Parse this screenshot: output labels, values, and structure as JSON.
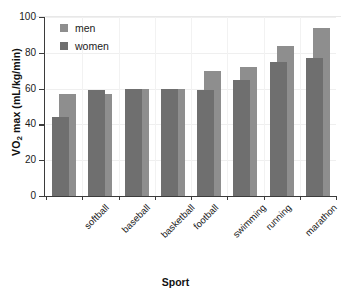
{
  "chart_data": {
    "type": "bar",
    "title": "",
    "xlabel": "Sport",
    "ylabel_html": "VO2 max (mL/kg/min)",
    "ylabel_main": "VO",
    "ylabel_sub": "2",
    "ylabel_rest": " max (mL/kg/min)",
    "categories": [
      "softball",
      "baseball",
      "basketball",
      "football",
      "swimming",
      "running",
      "marathon",
      "cross country skiing"
    ],
    "series": [
      {
        "name": "men",
        "color": "#8e8e8e",
        "values": [
          57,
          57,
          60,
          60,
          70,
          72,
          84,
          94
        ]
      },
      {
        "name": "women",
        "color": "#6f6f6f",
        "values": [
          44,
          59,
          60,
          60,
          59,
          65,
          75,
          77
        ]
      }
    ],
    "ylim": [
      0,
      100
    ],
    "yticks": [
      0,
      20,
      40,
      60,
      80,
      100
    ],
    "ytick_labels": [
      "0",
      "20",
      "40",
      "60",
      "80",
      "100"
    ],
    "grid": "horizontal-and-vertical-light",
    "legend_position": "top-left-inside",
    "legend_entries": [
      "men",
      "women"
    ]
  }
}
